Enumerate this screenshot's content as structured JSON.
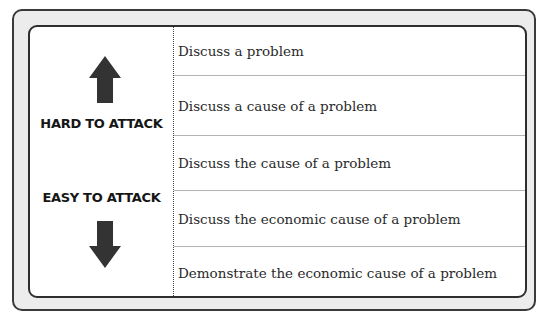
{
  "left_panel": {
    "top_label": "HARD TO ATTACK",
    "bottom_label": "EASY TO ATTACK",
    "top_icon": "arrow-up-icon",
    "bottom_icon": "arrow-down-icon"
  },
  "rows": [
    {
      "text": "Discuss a problem"
    },
    {
      "text": "Discuss a cause of a problem"
    },
    {
      "text": "Discuss the cause of a problem"
    },
    {
      "text": "Discuss the economic cause of a problem"
    },
    {
      "text": "Demonstrate the economic cause of a problem"
    }
  ],
  "colors": {
    "frame_fill": "#ececec",
    "border": "#2e2e2e",
    "row_line": "#b4b4b4",
    "arrow": "#333333"
  }
}
